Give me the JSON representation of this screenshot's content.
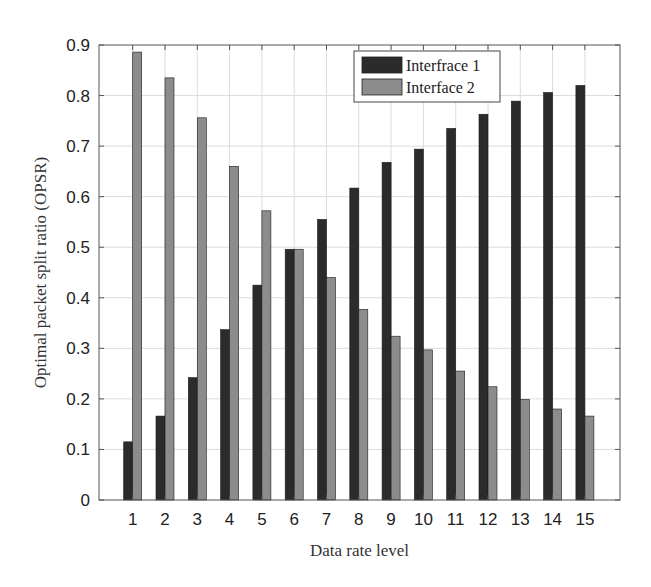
{
  "chart_data": {
    "type": "bar",
    "title": "",
    "xlabel": "Data rate level",
    "ylabel": "Optimal packet split ratio (OPSR)",
    "categories": [
      "1",
      "2",
      "3",
      "4",
      "5",
      "6",
      "7",
      "8",
      "9",
      "10",
      "11",
      "12",
      "13",
      "14",
      "15"
    ],
    "series": [
      {
        "name": "Interfrace 1",
        "color": "#2b2b2b",
        "values": [
          0.115,
          0.166,
          0.242,
          0.337,
          0.425,
          0.496,
          0.555,
          0.617,
          0.668,
          0.694,
          0.735,
          0.763,
          0.789,
          0.806,
          0.82
        ]
      },
      {
        "name": "Interface 2",
        "color": "#8c8c8c",
        "values": [
          0.886,
          0.835,
          0.756,
          0.66,
          0.572,
          0.496,
          0.44,
          0.377,
          0.324,
          0.297,
          0.255,
          0.224,
          0.199,
          0.18,
          0.166
        ]
      }
    ],
    "ylim": [
      0,
      0.9
    ],
    "yticks": [
      "0",
      "0.1",
      "0.2",
      "0.3",
      "0.4",
      "0.5",
      "0.6",
      "0.7",
      "0.8",
      "0.9"
    ],
    "grid": true,
    "legend_position": "upper-center-right"
  }
}
